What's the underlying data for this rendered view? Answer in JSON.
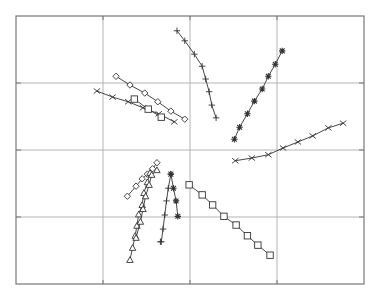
{
  "chart_data": {
    "type": "line",
    "title": "",
    "xlabel": "",
    "ylabel": "",
    "xlim": [
      0,
      4
    ],
    "ylim": [
      0,
      4
    ],
    "xticks": [
      1,
      2,
      3
    ],
    "yticks": [
      1,
      2,
      3
    ],
    "tick_labels_shown": false,
    "grid": true,
    "legend": null,
    "colors": {
      "line": "#333333",
      "grid": "#b4b4b4",
      "frame": "#777777",
      "background": "#ffffff"
    },
    "series": [
      {
        "name": "plus-upper",
        "marker": "plus",
        "x": [
          1.85,
          1.94,
          2.05,
          2.14,
          2.18,
          2.22,
          2.25,
          2.3
        ],
        "y": [
          3.78,
          3.63,
          3.43,
          3.25,
          3.06,
          2.87,
          2.67,
          2.48
        ]
      },
      {
        "name": "star-upper",
        "marker": "star",
        "x": [
          2.51,
          2.57,
          2.66,
          2.74,
          2.83,
          2.9,
          2.98,
          3.06
        ],
        "y": [
          2.16,
          2.34,
          2.54,
          2.73,
          2.91,
          3.1,
          3.28,
          3.48
        ]
      },
      {
        "name": "diamond-upper",
        "marker": "diamond",
        "x": [
          1.15,
          1.31,
          1.48,
          1.63,
          1.78,
          1.94
        ],
        "y": [
          3.1,
          2.97,
          2.85,
          2.72,
          2.58,
          2.46
        ]
      },
      {
        "name": "x-upper",
        "marker": "x",
        "x": [
          0.93,
          1.11,
          1.29,
          1.46,
          1.64,
          1.82
        ],
        "y": [
          2.88,
          2.79,
          2.72,
          2.63,
          2.54,
          2.42
        ]
      },
      {
        "name": "square-upper",
        "marker": "square",
        "x": [
          1.36,
          1.52,
          1.67
        ],
        "y": [
          2.76,
          2.61,
          2.49
        ]
      },
      {
        "name": "x-right",
        "marker": "x",
        "x": [
          2.52,
          2.71,
          2.9,
          3.07,
          3.24,
          3.41,
          3.59,
          3.76
        ],
        "y": [
          1.84,
          1.88,
          1.93,
          2.03,
          2.12,
          2.21,
          2.33,
          2.4
        ]
      },
      {
        "name": "square-lower",
        "marker": "square",
        "x": [
          1.99,
          2.14,
          2.26,
          2.39,
          2.53,
          2.66,
          2.78,
          2.92
        ],
        "y": [
          1.48,
          1.33,
          1.18,
          1.01,
          0.88,
          0.72,
          0.58,
          0.43
        ]
      },
      {
        "name": "diamond-lower",
        "marker": "diamond",
        "x": [
          1.28,
          1.38,
          1.45,
          1.51,
          1.57,
          1.62
        ],
        "y": [
          1.31,
          1.46,
          1.57,
          1.64,
          1.72,
          1.81
        ]
      },
      {
        "name": "triangle-lower-a",
        "marker": "triangle",
        "x": [
          1.31,
          1.34,
          1.37,
          1.39,
          1.41,
          1.45,
          1.47,
          1.51,
          1.54
        ],
        "y": [
          0.36,
          0.54,
          0.72,
          0.87,
          1.04,
          1.18,
          1.36,
          1.52,
          1.66
        ]
      },
      {
        "name": "triangle-lower-b",
        "marker": "triangle",
        "x": [
          1.38,
          1.43,
          1.46,
          1.49,
          1.53,
          1.56,
          1.62
        ],
        "y": [
          0.69,
          0.93,
          1.12,
          1.31,
          1.48,
          1.63,
          1.7
        ]
      },
      {
        "name": "plus-lower",
        "marker": "plus",
        "x": [
          1.78,
          1.75,
          1.73,
          1.71,
          1.69,
          1.67,
          1.66
        ],
        "y": [
          1.64,
          1.43,
          1.24,
          1.03,
          0.82,
          0.63,
          0.63
        ]
      },
      {
        "name": "star-lower",
        "marker": "star",
        "x": [
          1.78,
          1.81,
          1.84,
          1.86
        ],
        "y": [
          1.64,
          1.43,
          1.24,
          1.01
        ]
      }
    ]
  }
}
